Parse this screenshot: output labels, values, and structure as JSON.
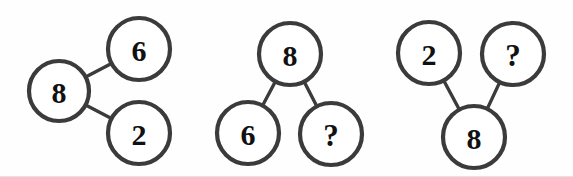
{
  "figure": {
    "background_color": "#fefefe",
    "stroke_color": "#3b3b3b",
    "text_color": "#111111",
    "width": 573,
    "height": 177
  },
  "groups": [
    {
      "id": "group-1",
      "name": "left-group",
      "layout": "left-root-two-right-children",
      "nodes": [
        {
          "id": "g1-n1",
          "label": "8",
          "role": "root",
          "cx": 59,
          "cy": 91,
          "r": 30
        },
        {
          "id": "g1-n2",
          "label": "6",
          "role": "child",
          "cx": 139,
          "cy": 49,
          "r": 31
        },
        {
          "id": "g1-n3",
          "label": "2",
          "role": "child",
          "cx": 139,
          "cy": 133,
          "r": 31
        }
      ],
      "edges": [
        {
          "from": "g1-n1",
          "to": "g1-n2"
        },
        {
          "from": "g1-n1",
          "to": "g1-n3"
        }
      ]
    },
    {
      "id": "group-2",
      "name": "middle-group",
      "layout": "top-root-two-bottom-children",
      "nodes": [
        {
          "id": "g2-n1",
          "label": "8",
          "role": "root",
          "cx": 290,
          "cy": 54,
          "r": 31
        },
        {
          "id": "g2-n2",
          "label": "6",
          "role": "child",
          "cx": 248,
          "cy": 133,
          "r": 31
        },
        {
          "id": "g2-n3",
          "label": "?",
          "role": "child",
          "cx": 331,
          "cy": 134,
          "r": 31
        }
      ],
      "edges": [
        {
          "from": "g2-n1",
          "to": "g2-n2"
        },
        {
          "from": "g2-n1",
          "to": "g2-n3"
        }
      ]
    },
    {
      "id": "group-3",
      "name": "right-group",
      "layout": "bottom-root-two-top-children",
      "nodes": [
        {
          "id": "g3-n1",
          "label": "2",
          "role": "child",
          "cx": 429,
          "cy": 53,
          "r": 31
        },
        {
          "id": "g3-n2",
          "label": "?",
          "role": "child",
          "cx": 513,
          "cy": 54,
          "r": 31
        },
        {
          "id": "g3-n3",
          "label": "8",
          "role": "root",
          "cx": 474,
          "cy": 137,
          "r": 31
        }
      ],
      "edges": [
        {
          "from": "g3-n3",
          "to": "g3-n1"
        },
        {
          "from": "g3-n3",
          "to": "g3-n2"
        }
      ]
    }
  ]
}
